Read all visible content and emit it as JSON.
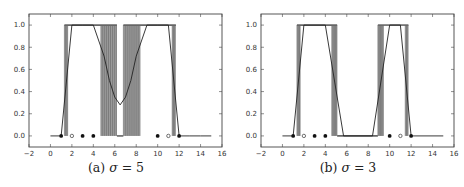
{
  "figure": {
    "panels": [
      {
        "id": "a",
        "caption_prefix": "(a) ",
        "caption_sigma": "σ",
        "caption_suffix": " = 5"
      },
      {
        "id": "b",
        "caption_prefix": "(b) ",
        "caption_sigma": "σ",
        "caption_suffix": " = 3"
      }
    ]
  },
  "chart_data": [
    {
      "type": "line",
      "title": "(a) σ = 5",
      "xlabel": "",
      "ylabel": "",
      "xlim": [
        -2,
        16
      ],
      "ylim": [
        -0.1,
        1.1
      ],
      "xticks": [
        -2,
        0,
        2,
        4,
        6,
        8,
        10,
        12,
        14,
        16
      ],
      "yticks": [
        0.0,
        0.2,
        0.4,
        0.6,
        0.8,
        1.0
      ],
      "grid": false,
      "legend": null,
      "colors": {
        "curve": "#222222",
        "bands": "#8c8c8c",
        "axes": "#444444"
      },
      "series": [
        {
          "name": "smooth curve",
          "style": "line",
          "x": [
            0,
            1,
            2,
            3,
            4,
            5,
            5.5,
            6,
            6.5,
            7,
            7.5,
            8,
            9,
            10,
            11,
            12,
            13,
            14,
            15
          ],
          "y": [
            0,
            0,
            1,
            1,
            1,
            0.72,
            0.5,
            0.35,
            0.28,
            0.35,
            0.5,
            0.72,
            1,
            1,
            1,
            0,
            0,
            0,
            0
          ]
        },
        {
          "name": "step samples (gray bands)",
          "style": "bands",
          "bands": [
            {
              "x0": 1.3,
              "x1": 1.65,
              "y0": 0,
              "y1": 1
            },
            {
              "x0": 4.7,
              "x1": 6.2,
              "y0": 0,
              "y1": 1,
              "dense": true
            },
            {
              "x0": 6.8,
              "x1": 8.4,
              "y0": 0,
              "y1": 1,
              "dense": true
            },
            {
              "x0": 11.35,
              "x1": 11.7,
              "y0": 0,
              "y1": 1
            }
          ],
          "top_segments": [
            [
              1.3,
              6.2
            ],
            [
              6.8,
              11.7
            ]
          ],
          "bottom_segments": [
            [
              6.2,
              6.8
            ]
          ]
        },
        {
          "name": "filled points",
          "style": "marker-filled",
          "x": [
            1,
            3,
            4,
            10,
            12
          ],
          "y": [
            0,
            0,
            0,
            0,
            0
          ]
        },
        {
          "name": "open points",
          "style": "marker-open",
          "x": [
            2,
            11
          ],
          "y": [
            0,
            0
          ]
        }
      ]
    },
    {
      "type": "line",
      "title": "(b) σ = 3",
      "xlabel": "",
      "ylabel": "",
      "xlim": [
        -2,
        16
      ],
      "ylim": [
        -0.1,
        1.1
      ],
      "xticks": [
        -2,
        0,
        2,
        4,
        6,
        8,
        10,
        12,
        14,
        16
      ],
      "yticks": [
        0.0,
        0.2,
        0.4,
        0.6,
        0.8,
        1.0
      ],
      "grid": false,
      "legend": null,
      "colors": {
        "curve": "#222222",
        "bands": "#8c8c8c",
        "axes": "#444444"
      },
      "series": [
        {
          "name": "smooth curve",
          "style": "line",
          "x": [
            0,
            1,
            2,
            4,
            5.7,
            8.4,
            10,
            11,
            12,
            15
          ],
          "y": [
            0,
            0,
            1,
            1,
            0,
            0,
            1,
            1,
            0,
            0
          ]
        },
        {
          "name": "step samples (gray bands)",
          "style": "bands",
          "bands": [
            {
              "x0": 1.35,
              "x1": 1.7,
              "y0": 0,
              "y1": 1
            },
            {
              "x0": 4.6,
              "x1": 5.1,
              "y0": 0,
              "y1": 1
            },
            {
              "x0": 8.9,
              "x1": 9.45,
              "y0": 0,
              "y1": 1
            },
            {
              "x0": 11.45,
              "x1": 11.75,
              "y0": 0,
              "y1": 1
            }
          ],
          "top_segments": [
            [
              1.35,
              5.1
            ],
            [
              8.9,
              11.75
            ]
          ],
          "bottom_segments": [
            [
              5.1,
              8.9
            ]
          ]
        },
        {
          "name": "filled points",
          "style": "marker-filled",
          "x": [
            1,
            3,
            4,
            10,
            12
          ],
          "y": [
            0,
            0,
            0,
            0,
            0
          ]
        },
        {
          "name": "open points",
          "style": "marker-open",
          "x": [
            2,
            11
          ],
          "y": [
            0,
            0
          ]
        }
      ]
    }
  ]
}
